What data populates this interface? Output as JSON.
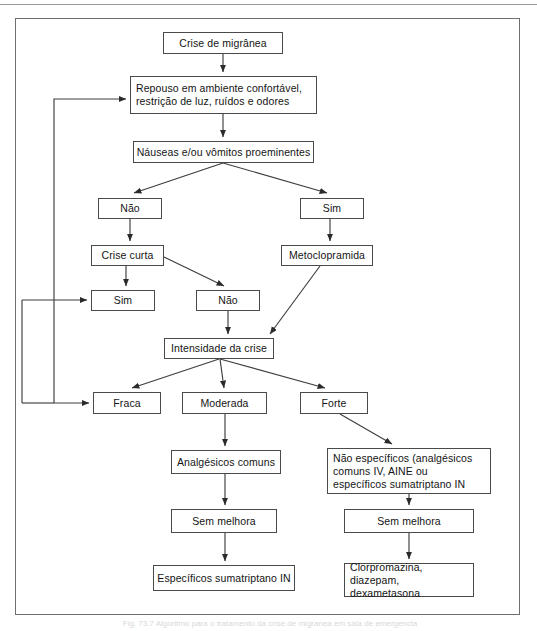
{
  "figure": {
    "title_hidden_caption": "Fig. 73.7 Algoritmo para o tratamento da crise de migranea em sala de emergencia",
    "frame_border_color": "#6f6f6f",
    "node_border_color": "#4a4a4a",
    "edge_color": "#3d3d3d",
    "background": "#ffffff"
  },
  "flowchart": {
    "type": "flowchart",
    "language": "pt-BR",
    "nodes": [
      {
        "id": "crise",
        "label": "Crise de migrânea",
        "x": 163,
        "y": 32,
        "w": 120,
        "h": 22
      },
      {
        "id": "repouso",
        "label": "Repouso em ambiente confortável,\nrestrição de luz, ruídos e odores",
        "x": 130,
        "y": 76,
        "w": 187,
        "h": 38
      },
      {
        "id": "nauseas",
        "label": "Náuseas e/ou vômitos proeminentes",
        "x": 133,
        "y": 141,
        "w": 181,
        "h": 22
      },
      {
        "id": "nao1",
        "label": "Não",
        "x": 98,
        "y": 198,
        "w": 64,
        "h": 21
      },
      {
        "id": "sim1",
        "label": "Sim",
        "x": 300,
        "y": 198,
        "w": 64,
        "h": 21
      },
      {
        "id": "crise_curta",
        "label": "Crise curta",
        "x": 91,
        "y": 245,
        "w": 73,
        "h": 21
      },
      {
        "id": "metoclo",
        "label": "Metoclopramida",
        "x": 281,
        "y": 245,
        "w": 92,
        "h": 21
      },
      {
        "id": "sim2",
        "label": "Sim",
        "x": 91,
        "y": 290,
        "w": 64,
        "h": 21
      },
      {
        "id": "nao2",
        "label": "Não",
        "x": 196,
        "y": 290,
        "w": 64,
        "h": 21
      },
      {
        "id": "intensidade",
        "label": "Intensidade da crise",
        "x": 164,
        "y": 338,
        "w": 110,
        "h": 21
      },
      {
        "id": "fraca",
        "label": "Fraca",
        "x": 93,
        "y": 392,
        "w": 68,
        "h": 22
      },
      {
        "id": "moderada",
        "label": "Moderada",
        "x": 182,
        "y": 392,
        "w": 85,
        "h": 22
      },
      {
        "id": "forte",
        "label": "Forte",
        "x": 300,
        "y": 392,
        "w": 68,
        "h": 22
      },
      {
        "id": "analgesicos",
        "label": "Analgésicos comuns",
        "x": 171,
        "y": 450,
        "w": 110,
        "h": 24
      },
      {
        "id": "nao_espec",
        "label": "Não específicos (analgésicos\ncomuns IV, AINE ou\nespecíficos sumatriptano IN",
        "x": 327,
        "y": 448,
        "w": 164,
        "h": 46
      },
      {
        "id": "sem_melhora1",
        "label": "Sem melhora",
        "x": 171,
        "y": 509,
        "w": 106,
        "h": 24
      },
      {
        "id": "sem_melhora2",
        "label": "Sem melhora",
        "x": 344,
        "y": 509,
        "w": 130,
        "h": 24
      },
      {
        "id": "espec_final",
        "label": "Específicos sumatriptano IN",
        "x": 153,
        "y": 565,
        "w": 142,
        "h": 26
      },
      {
        "id": "clorpro",
        "label": "Clorpromazina, diazepam,\ndexametasona",
        "x": 344,
        "y": 563,
        "w": 130,
        "h": 34
      }
    ],
    "edges": [
      {
        "from": "crise",
        "to": "repouso",
        "kind": "straight-down"
      },
      {
        "from": "repouso",
        "to": "nauseas",
        "kind": "straight-down"
      },
      {
        "from": "nauseas",
        "to": "nao1",
        "kind": "diagonal-left"
      },
      {
        "from": "nauseas",
        "to": "sim1",
        "kind": "diagonal-right"
      },
      {
        "from": "nao1",
        "to": "crise_curta",
        "kind": "straight-down"
      },
      {
        "from": "sim1",
        "to": "metoclo",
        "kind": "straight-down"
      },
      {
        "from": "crise_curta",
        "to": "sim2",
        "kind": "straight-down"
      },
      {
        "from": "crise_curta",
        "to": "nao2",
        "kind": "diagonal-right"
      },
      {
        "from": "nao2",
        "to": "intensidade",
        "kind": "straight-down"
      },
      {
        "from": "metoclo",
        "to": "intensidade",
        "kind": "diagonal-left"
      },
      {
        "from": "intensidade",
        "to": "fraca",
        "kind": "diagonal-left"
      },
      {
        "from": "intensidade",
        "to": "moderada",
        "kind": "straight-down"
      },
      {
        "from": "intensidade",
        "to": "forte",
        "kind": "diagonal-right"
      },
      {
        "from": "moderada",
        "to": "analgesicos",
        "kind": "straight-down"
      },
      {
        "from": "forte",
        "to": "nao_espec",
        "kind": "diagonal-right"
      },
      {
        "from": "analgesicos",
        "to": "sem_melhora1",
        "kind": "straight-down"
      },
      {
        "from": "nao_espec",
        "to": "sem_melhora2",
        "kind": "straight-down"
      },
      {
        "from": "sem_melhora1",
        "to": "espec_final",
        "kind": "straight-down"
      },
      {
        "from": "sem_melhora2",
        "to": "clorpro",
        "kind": "straight-down"
      },
      {
        "from": "sim2",
        "to": "repouso",
        "kind": "feedback-loop"
      },
      {
        "from": "fraca",
        "to": "repouso",
        "kind": "feedback-loop"
      }
    ]
  }
}
